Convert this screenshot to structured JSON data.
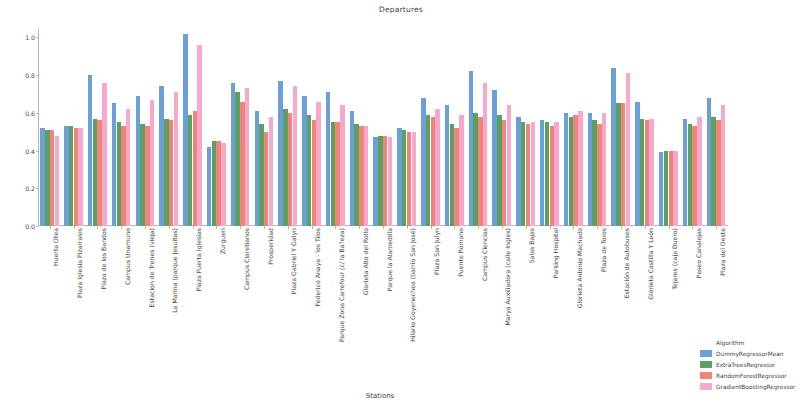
{
  "chart_data": {
    "type": "bar",
    "title": "Departures",
    "xlabel": "Stations",
    "ylabel": "Root Mean Squared Log Error RMSLE",
    "ylim": [
      0.0,
      1.05
    ],
    "yticks": [
      "0.0",
      "0.2",
      "0.4",
      "0.6",
      "0.8",
      "1.0"
    ],
    "ytick_values": [
      0.0,
      0.2,
      0.4,
      0.6,
      0.8,
      1.0
    ],
    "grid": false,
    "legend_title": "Algorithm",
    "legend_position": "lower right (outside axes)",
    "categories": [
      "Huerta Otea",
      "Plaza Iglesia Pizarrales",
      "Plaza de los Bandos",
      "Campus Unamuno",
      "Estacion de Trenes (vieja)",
      "La Marina (parque Jesuitas)",
      "Plaza Puerta Iglesias",
      "Zurguen",
      "Campus Claretianos",
      "Prosperidad",
      "Plaza Gabriel Y Galyn",
      "Federico Anaya - los Tilos",
      "Parque Zona Carrefour (c/ la Ba?eza)",
      "Glorieta Alto del Rollo",
      "Parque la Alamedilla",
      "Hilario Goyenechea (barrio San José)",
      "Plaza San Julyn",
      "Puente Romano",
      "Campus Ciencias",
      "Marya Auxiliadora (calle Ingles)",
      "Salas Bajas",
      "Parking Hospital",
      "Glorieta Antonio Machado",
      "Plaza de Toros",
      "Estación de Autobuses",
      "Glorieta Castilla Y León",
      "Tejares (caja Duero)",
      "Paseo Canalejas",
      "Plaza del Oeste"
    ],
    "series": [
      {
        "name": "DummyRegressorMean",
        "color": "#6a9fd8",
        "values": [
          0.52,
          0.53,
          0.8,
          0.65,
          0.69,
          0.74,
          1.02,
          0.42,
          0.76,
          0.61,
          0.77,
          0.69,
          0.71,
          0.61,
          0.47,
          0.52,
          0.68,
          0.64,
          0.82,
          0.72,
          0.58,
          0.56,
          0.6,
          0.6,
          0.84,
          0.66,
          0.39,
          0.57,
          0.68
        ]
      },
      {
        "name": "ExtraTreesRegressor",
        "color": "#5ba05f",
        "values": [
          0.51,
          0.53,
          0.57,
          0.55,
          0.54,
          0.57,
          0.59,
          0.45,
          0.71,
          0.54,
          0.62,
          0.59,
          0.55,
          0.54,
          0.48,
          0.51,
          0.59,
          0.54,
          0.6,
          0.59,
          0.55,
          0.55,
          0.58,
          0.56,
          0.65,
          0.57,
          0.4,
          0.54,
          0.58
        ]
      },
      {
        "name": "RandomForestRegressor",
        "color": "#f0837a"
      },
      {
        "name": "GradientBoostingRegressor",
        "color": "#f9a8cb"
      }
    ],
    "series_values": {
      "RandomForestRegressor": [
        0.51,
        0.52,
        0.56,
        0.53,
        0.53,
        0.56,
        0.61,
        0.45,
        0.66,
        0.5,
        0.6,
        0.56,
        0.55,
        0.53,
        0.48,
        0.5,
        0.58,
        0.52,
        0.58,
        0.56,
        0.54,
        0.53,
        0.59,
        0.54,
        0.65,
        0.56,
        0.4,
        0.53,
        0.56
      ]
    },
    "series_values_2": {
      "GradientBoostingRegressor": [
        0.48,
        0.52,
        0.76,
        0.62,
        0.67,
        0.71,
        0.96,
        0.44,
        0.73,
        0.58,
        0.74,
        0.66,
        0.64,
        0.53,
        0.47,
        0.5,
        0.62,
        0.59,
        0.76,
        0.64,
        0.55,
        0.55,
        0.61,
        0.6,
        0.81,
        0.57,
        0.4,
        0.58,
        0.64
      ]
    }
  },
  "legend": {
    "title": "Algorithm",
    "entries": [
      {
        "label": "DummyRegressorMean",
        "color": "#6a9fd8"
      },
      {
        "label": "ExtraTreesRegressor",
        "color": "#5ba05f"
      },
      {
        "label": "RandomForestRegressor",
        "color": "#f0837a"
      },
      {
        "label": "GradientBoostingRegressor",
        "color": "#f9a8cb"
      }
    ]
  }
}
